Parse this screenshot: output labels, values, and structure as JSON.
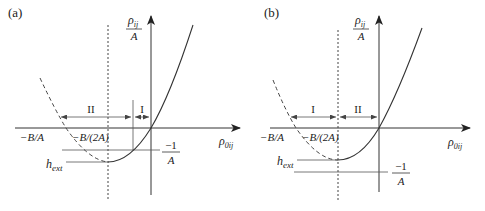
{
  "panels": [
    {
      "id": "a",
      "label": "(a)",
      "y_axis_label_num": "ρ",
      "y_axis_label_num_sub": "ij",
      "y_axis_label_den": "A",
      "x_axis_label": "ρ",
      "x_axis_label_sub": "0ij",
      "tick_neg_B_A": "−B/A",
      "tick_neg_B_2A": "−B/(2A)",
      "h_ext": "h",
      "h_ext_sub": "ext",
      "minus_one_num": "−1",
      "minus_one_den": "A",
      "region_left": "II",
      "region_right": "I"
    },
    {
      "id": "b",
      "label": "(b)",
      "y_axis_label_num": "ρ",
      "y_axis_label_num_sub": "ij",
      "y_axis_label_den": "A",
      "x_axis_label": "ρ",
      "x_axis_label_sub": "0ij",
      "tick_neg_B_A": "−B/A",
      "tick_neg_B_2A": "−B/(2A)",
      "h_ext": "h",
      "h_ext_sub": "ext",
      "minus_one_num": "−1",
      "minus_one_den": "A",
      "region_left": "I",
      "region_right": "II"
    }
  ],
  "colors": {
    "line": "#333333",
    "background": "#ffffff"
  }
}
